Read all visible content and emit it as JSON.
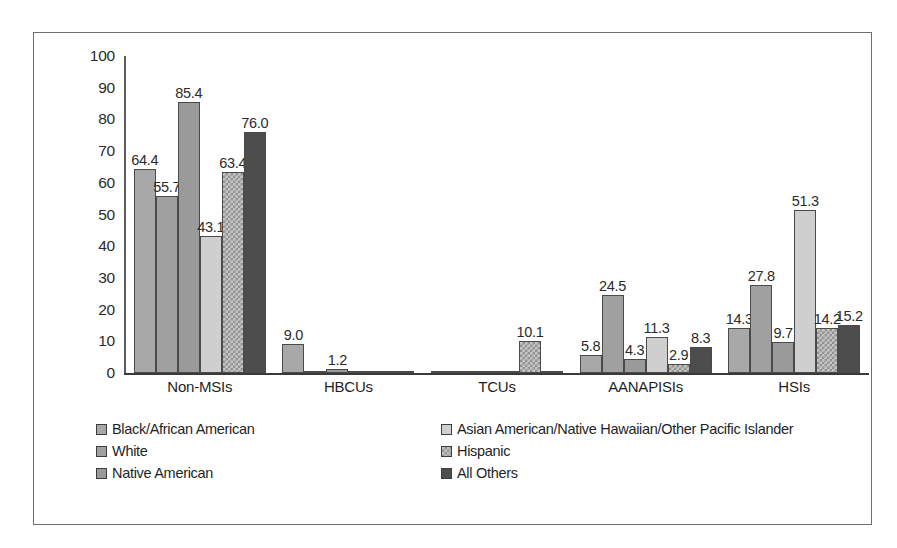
{
  "chart_data": {
    "type": "bar",
    "title": "",
    "xlabel": "",
    "ylabel": "",
    "ylim": [
      0,
      100
    ],
    "yticks": [
      100,
      90,
      80,
      70,
      60,
      50,
      40,
      30,
      20,
      10,
      0
    ],
    "grid": false,
    "legend_position": "bottom",
    "categories": [
      "Non-MSIs",
      "HBCUs",
      "TCUs",
      "AANAPISIs",
      "HSIs"
    ],
    "series": [
      {
        "name": "Black/African American",
        "color": "#a8a8a8",
        "values": [
          64.4,
          9.0,
          0.1,
          5.8,
          14.3
        ],
        "labels": [
          "64.4",
          "9.0",
          "",
          "5.8",
          "14.3"
        ]
      },
      {
        "name": "White",
        "color": "#a0a0a0",
        "values": [
          55.7,
          0.2,
          0.2,
          24.5,
          27.8
        ],
        "labels": [
          "55.7",
          "",
          "",
          "24.5",
          "27.8"
        ]
      },
      {
        "name": "Native American",
        "color": "#9a9a9a",
        "values": [
          85.4,
          1.2,
          0.3,
          4.3,
          9.7
        ],
        "labels": [
          "85.4",
          "1.2",
          "",
          "4.3",
          "9.7"
        ]
      },
      {
        "name": "Asian American/Native Hawaiian/Other Pacific Islander",
        "color": "#cfcfcf",
        "values": [
          43.1,
          0.3,
          0.2,
          11.3,
          51.3
        ],
        "labels": [
          "43.1",
          "",
          "",
          "11.3",
          "51.3"
        ]
      },
      {
        "name": "Hispanic",
        "color": "#c4c4c4",
        "values": [
          63.4,
          0.3,
          10.1,
          2.9,
          14.2
        ],
        "labels": [
          "63.4",
          "",
          "10.1",
          "2.9",
          "14.2"
        ]
      },
      {
        "name": "All Others",
        "color": "#4d4d4d",
        "values": [
          76.0,
          0.3,
          0.2,
          8.3,
          15.2
        ],
        "labels": [
          "76.0",
          "",
          "",
          "8.3",
          "15.2"
        ]
      }
    ]
  },
  "legend": {
    "left_column": [
      "Black/African American",
      "White",
      "Native American"
    ],
    "right_column": [
      "Asian American/Native Hawaiian/Other Pacific Islander",
      "Hispanic",
      "All Others"
    ]
  }
}
